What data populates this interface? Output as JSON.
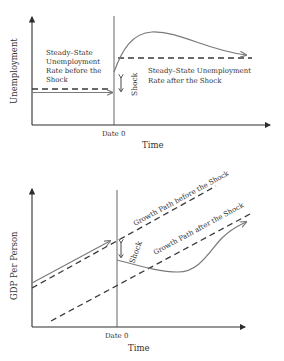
{
  "colors": {
    "axis": "#2e2e2e",
    "curve": "#7a7a7a",
    "dashed": "#3a3a3a",
    "text": "#333333"
  },
  "top_panel": {
    "y_axis_label": "Unemployment",
    "x_axis_label": "Time",
    "date_label": "Date 0",
    "shock_label": "Shock",
    "before_label_lines": [
      "Steady–State",
      "Unemployment",
      "Rate before the",
      "Shock"
    ],
    "after_label_lines": [
      "Steady–State Unemployment",
      "Rate after the Shock"
    ]
  },
  "bottom_panel": {
    "y_axis_label": "GDP Per Person",
    "x_axis_label": "Time",
    "date_label": "Date 0",
    "shock_label": "Shock",
    "before_path_label": "Growth Path before the Shock",
    "after_path_label": "Growth Path after the Shock"
  }
}
